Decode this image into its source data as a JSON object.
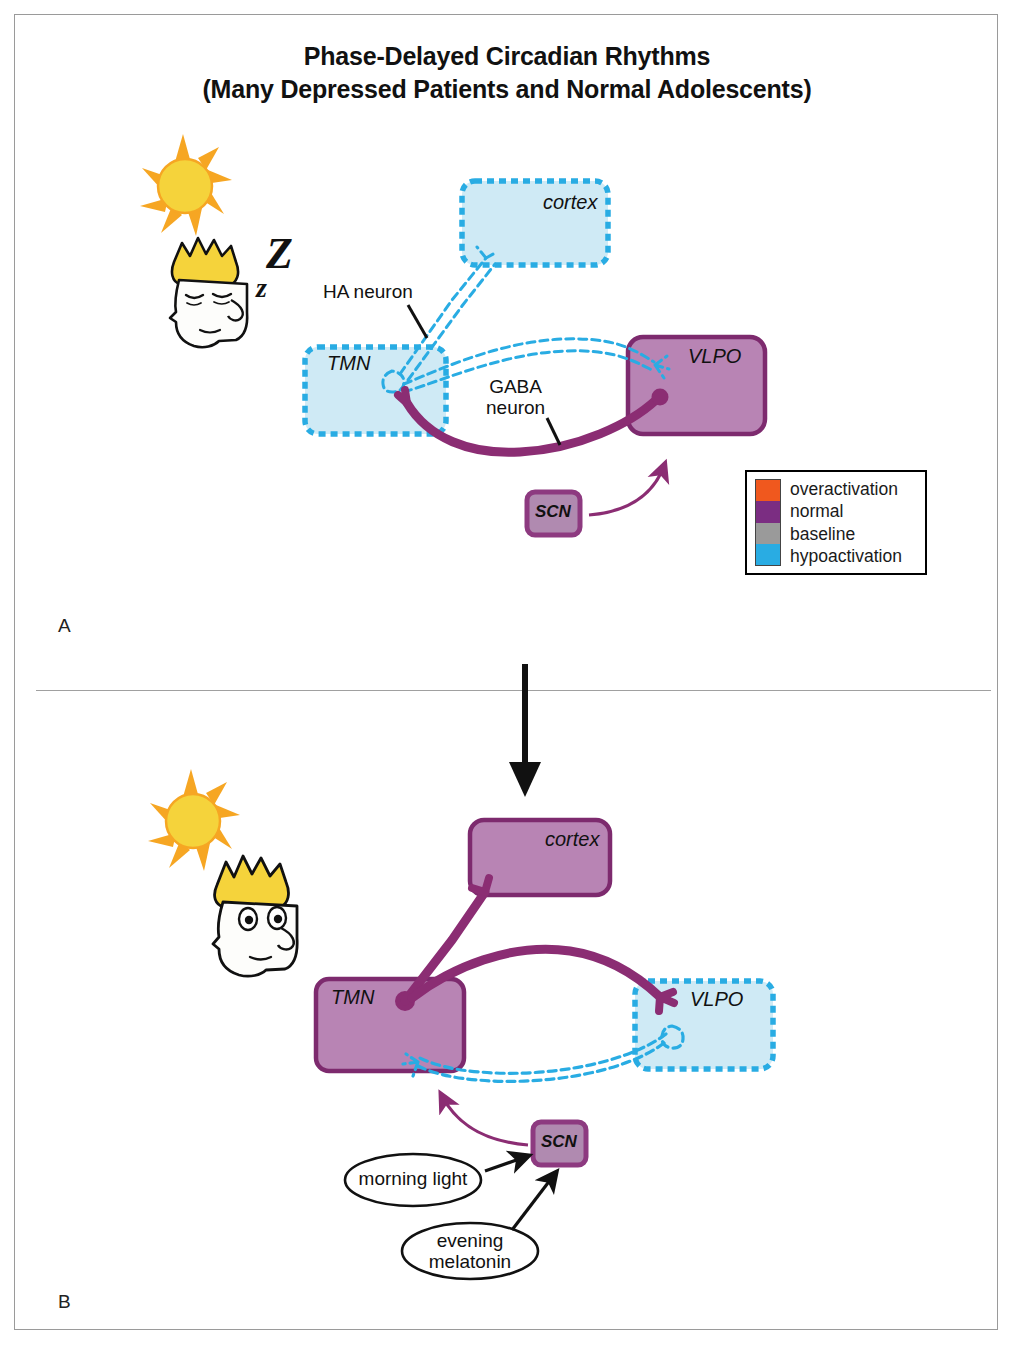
{
  "figure": {
    "title_line1": "Phase-Delayed Circadian Rhythms",
    "title_line2": "(Many Depressed Patients and Normal Adolescents)",
    "panel_a_label": "A",
    "panel_b_label": "B"
  },
  "legend": {
    "items": [
      {
        "label": "overactivation",
        "color": "#f0581e"
      },
      {
        "label": "normal",
        "color": "#7b2d82"
      },
      {
        "label": "baseline",
        "color": "#9a9a9a"
      },
      {
        "label": "hypoactivation",
        "color": "#29ace3"
      }
    ]
  },
  "colors": {
    "purple_fill": "#b884b4",
    "purple_border": "#7d2a6e",
    "blue_fill": "#cfeaf5",
    "blue_border": "#29ace3",
    "neuron_purple": "#8b2d73",
    "scn_border": "#8d3a80",
    "scn_fill": "#b08ab0",
    "sun_fill": "#f5d33b",
    "sun_ray": "#f6a623",
    "hair": "#f5d33b",
    "outline": "#111111",
    "frame": "#9a9a9a"
  },
  "panel_a": {
    "state": "sleep",
    "regions": [
      {
        "name": "cortex",
        "label": "cortex",
        "activation": "hypoactivation"
      },
      {
        "name": "TMN",
        "label": "TMN",
        "activation": "hypoactivation"
      },
      {
        "name": "VLPO",
        "label": "VLPO",
        "activation": "normal"
      },
      {
        "name": "SCN",
        "label": "SCN",
        "activation": "normal"
      }
    ],
    "annotations": [
      {
        "name": "ha-neuron",
        "line1": "HA neuron"
      },
      {
        "name": "gaba-neuron",
        "line1": "GABA",
        "line2": "neuron"
      }
    ],
    "sleep_marks": [
      "Z",
      "z"
    ],
    "face_state": "asleep"
  },
  "panel_b": {
    "state": "wake",
    "regions": [
      {
        "name": "cortex",
        "label": "cortex",
        "activation": "normal"
      },
      {
        "name": "TMN",
        "label": "TMN",
        "activation": "normal"
      },
      {
        "name": "VLPO",
        "label": "VLPO",
        "activation": "hypoactivation"
      },
      {
        "name": "SCN",
        "label": "SCN",
        "activation": "normal"
      }
    ],
    "inputs": [
      {
        "name": "morning-light",
        "line1": "morning light",
        "line2": ""
      },
      {
        "name": "evening-melatonin",
        "line1": "evening",
        "line2": "melatonin"
      }
    ],
    "face_state": "awake"
  }
}
